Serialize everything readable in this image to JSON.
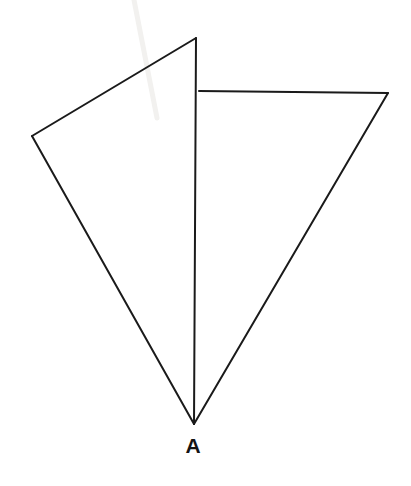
{
  "figure": {
    "background_color": "#ffffff",
    "stroke_color": "#1a1a1a",
    "stroke_width": 2,
    "width": 411,
    "height": 486,
    "labels": [
      {
        "id": "apex-a",
        "text": "A",
        "x": 193,
        "y": 453,
        "color": "#141414",
        "font_size": 21,
        "bold": true
      }
    ],
    "vertices": [
      {
        "id": "top",
        "name": "top-vertex",
        "x": 196,
        "y": 38
      },
      {
        "id": "left",
        "name": "left-vertex",
        "x": 32,
        "y": 136
      },
      {
        "id": "apex",
        "name": "apex-vertex-a",
        "x": 194,
        "y": 424
      },
      {
        "id": "mid-right",
        "name": "shared-edge-junction",
        "x": 199,
        "y": 91
      },
      {
        "id": "right",
        "name": "right-vertex",
        "x": 388,
        "y": 93
      }
    ],
    "shapes": [
      {
        "id": "left-triangle",
        "name": "left-triangle",
        "points": "196,38 32,136 194,424",
        "fill": "none"
      },
      {
        "id": "right-triangle",
        "name": "right-triangle",
        "points": "199,91 388,93 194,424",
        "fill": "none"
      }
    ],
    "edges": [
      {
        "id": "edge-top-left",
        "name": "edge-top-to-left",
        "x1": 196,
        "y1": 38,
        "x2": 32,
        "y2": 136
      },
      {
        "id": "edge-left-apex",
        "name": "edge-left-to-apex",
        "x1": 32,
        "y1": 136,
        "x2": 194,
        "y2": 424
      },
      {
        "id": "edge-vertical",
        "name": "edge-top-to-apex-vertical",
        "x1": 196,
        "y1": 38,
        "x2": 194,
        "y2": 424
      },
      {
        "id": "edge-horizontal",
        "name": "edge-junction-to-right-horizontal",
        "x1": 199,
        "y1": 91,
        "x2": 388,
        "y2": 93
      },
      {
        "id": "edge-right-apex",
        "name": "edge-right-to-apex",
        "x1": 388,
        "y1": 93,
        "x2": 194,
        "y2": 424
      }
    ],
    "artifacts": [
      {
        "id": "scan-streak",
        "name": "scan-streak-artifact",
        "x1": 134,
        "y1": 0,
        "x2": 157,
        "y2": 118,
        "color": "#f2f1ef",
        "width": 5
      }
    ]
  }
}
